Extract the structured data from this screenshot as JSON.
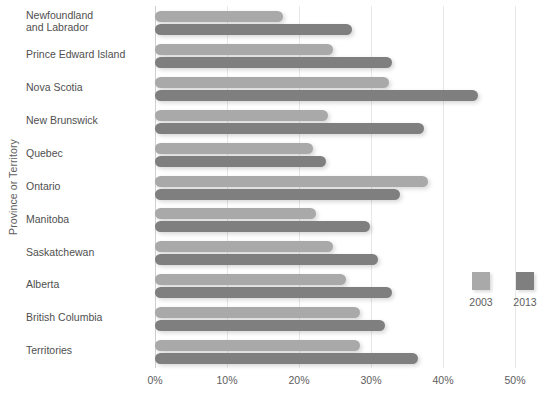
{
  "chart_data": {
    "type": "bar",
    "orientation": "horizontal",
    "title": "",
    "xlabel": "",
    "ylabel": "Province or Territory",
    "xlim": [
      0,
      50
    ],
    "xticks": [
      0,
      10,
      20,
      30,
      40,
      50
    ],
    "xtick_labels": [
      "0%",
      "10%",
      "20%",
      "30%",
      "40%",
      "50%"
    ],
    "grid": true,
    "legend_position": "right",
    "categories": [
      "Newfoundland\nand Labrador",
      "Prince Edward Island",
      "Nova Scotia",
      "New Brunswick",
      "Quebec",
      "Ontario",
      "Manitoba",
      "Saskatchewan",
      "Alberta",
      "British Columbia",
      "Territories"
    ],
    "series": [
      {
        "name": "2003",
        "color": "#a9a9a9",
        "values": [
          17.8,
          24.7,
          32.5,
          24.0,
          22.0,
          37.9,
          22.4,
          24.7,
          26.5,
          28.5,
          28.5
        ]
      },
      {
        "name": "2013",
        "color": "#7f7f7f",
        "values": [
          27.4,
          32.9,
          44.9,
          37.4,
          23.7,
          34.0,
          29.9,
          31.0,
          32.9,
          31.9,
          36.5
        ]
      }
    ]
  },
  "legend": {
    "items": [
      {
        "label": "2003",
        "color": "#a9a9a9"
      },
      {
        "label": "2013",
        "color": "#7f7f7f"
      }
    ]
  }
}
